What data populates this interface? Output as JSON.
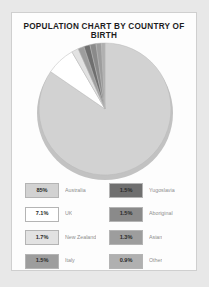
{
  "chart_data": {
    "type": "pie",
    "title": "POPULATION CHART BY COUNTRY OF BIRTH",
    "categories": [
      "Australia",
      "UK",
      "New Zealand",
      "Italy",
      "Yugoslavia",
      "Aboriginal",
      "Asian",
      "Other"
    ],
    "values": [
      85,
      7.1,
      1.7,
      1.5,
      1.5,
      1.5,
      1.3,
      0.9
    ],
    "value_labels": [
      "85%",
      "7.1%",
      "1.7%",
      "1.5%",
      "1.5%",
      "1.5%",
      "1.3%",
      "0.9%"
    ],
    "colors": [
      "#d2d2d2",
      "#ffffff",
      "#e2e2e2",
      "#9d9d9d",
      "#6f6f6f",
      "#8a8a8a",
      "#9d9d9d",
      "#b0b0b0"
    ],
    "legend_position": "bottom",
    "grid": false,
    "xlabel": "",
    "ylabel": ""
  },
  "card": {
    "title": "POPULATION CHART BY COUNTRY OF BIRTH"
  },
  "legend": {
    "items": [
      {
        "value": "85%",
        "label": "Australia",
        "color": "#d2d2d2"
      },
      {
        "value": "1.5%",
        "label": "Yugoslavia",
        "color": "#6f6f6f"
      },
      {
        "value": "7.1%",
        "label": "UK",
        "color": "#ffffff"
      },
      {
        "value": "1.5%",
        "label": "Aboriginal",
        "color": "#8a8a8a"
      },
      {
        "value": "1.7%",
        "label": "New Zealand",
        "color": "#e2e2e2"
      },
      {
        "value": "1.3%",
        "label": "Asian",
        "color": "#9d9d9d"
      },
      {
        "value": "1.5%",
        "label": "Italy",
        "color": "#9d9d9d"
      },
      {
        "value": "0.9%",
        "label": "Other",
        "color": "#b0b0b0"
      }
    ]
  }
}
